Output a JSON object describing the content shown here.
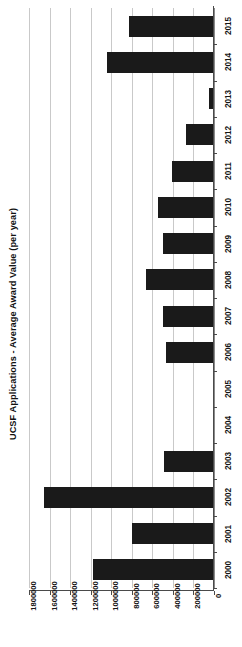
{
  "chart_data": {
    "type": "bar",
    "orientation": "horizontal",
    "title": "UCSF Applications - Average Award Value (per year)",
    "xlabel": "",
    "ylabel": "",
    "categories": [
      "2000",
      "2001",
      "2002",
      "2003",
      "2004",
      "2005",
      "2006",
      "2007",
      "2008",
      "2009",
      "2010",
      "2011",
      "2012",
      "2013",
      "2014",
      "2015"
    ],
    "values": [
      1175000,
      800000,
      1650000,
      485000,
      0,
      0,
      465000,
      495000,
      660000,
      495000,
      545000,
      410000,
      270000,
      50000,
      1040000,
      830000
    ],
    "series": [
      {
        "name": "Average Award Value",
        "values": [
          1175000,
          800000,
          1650000,
          485000,
          0,
          0,
          465000,
          495000,
          660000,
          495000,
          545000,
          410000,
          270000,
          50000,
          1040000,
          830000
        ]
      }
    ],
    "value_axis_ticks": [
      0,
      200000,
      400000,
      600000,
      800000,
      1000000,
      1200000,
      1400000,
      1600000,
      1800000
    ],
    "value_axis_tick_labels": [
      "0",
      "200000",
      "400000",
      "600000",
      "800000",
      "1000000",
      "1200000",
      "1400000",
      "1600000",
      "1800000"
    ],
    "xlim": [
      0,
      1800000
    ],
    "grid": true,
    "legend": false,
    "bar_color": "#1a1a1a",
    "gridline_color": "#c9c9c9",
    "axis_color": "#4a4a4a",
    "background_color": "#ffffff",
    "category_order_top_to_bottom": [
      "2015",
      "2014",
      "2013",
      "2012",
      "2011",
      "2010",
      "2009",
      "2008",
      "2007",
      "2006",
      "2005",
      "2004",
      "2003",
      "2002",
      "2001",
      "2000"
    ]
  }
}
